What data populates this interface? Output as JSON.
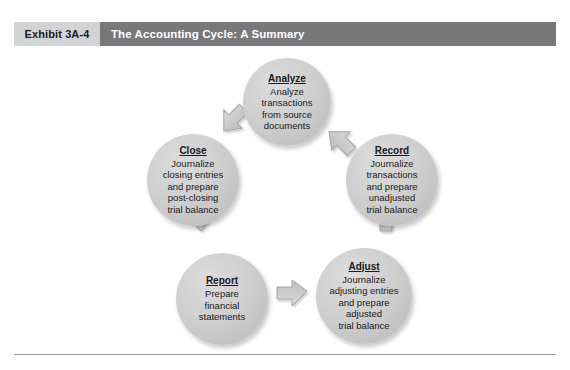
{
  "page": {
    "top_bleed_text": "· ·  ·       · ·                     ·                ·        ·"
  },
  "header": {
    "exhibit_number": "Exhibit 3A-4",
    "title": "The Accounting Cycle: A Summary",
    "number_box_color": "#d2d3d5",
    "title_bar_color": "#78787a",
    "title_text_color": "#ffffff"
  },
  "diagram": {
    "type": "cycle",
    "direction": "clockwise",
    "node_fill_color": "#cfcfcf",
    "arrow_fill_color": "#c9c9c9",
    "arrow_stroke_color": "#9a9a9a",
    "nodes": [
      {
        "id": "analyze",
        "title": "Analyze",
        "body": "Analyze\ntransactions\nfrom source\ndocuments"
      },
      {
        "id": "record",
        "title": "Record",
        "body": "Journalize\ntransactions\nand prepare\nunadjusted\ntrial balance"
      },
      {
        "id": "adjust",
        "title": "Adjust",
        "body": "Journalize\nadjusting entries\nand prepare\nadjusted\ntrial balance"
      },
      {
        "id": "report",
        "title": "Report",
        "body": "Prepare\nfinancial\nstatements"
      },
      {
        "id": "close",
        "title": "Close",
        "body": "Journalize\nclosing entries\nand prepare\npost-closing\ntrial balance"
      }
    ],
    "arrows": [
      {
        "from": "analyze",
        "to": "record"
      },
      {
        "from": "record",
        "to": "adjust"
      },
      {
        "from": "adjust",
        "to": "report"
      },
      {
        "from": "report",
        "to": "close"
      },
      {
        "from": "close",
        "to": "analyze"
      }
    ]
  }
}
